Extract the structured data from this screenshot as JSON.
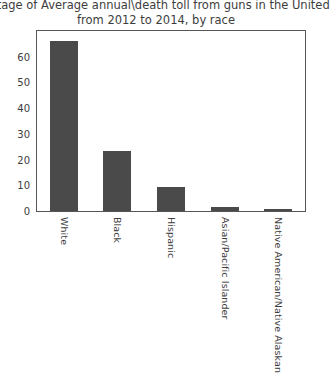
{
  "chart_data": {
    "type": "bar",
    "title": "entage of Average annual\\death toll from guns in the United",
    "title_line2": "from 2012 to 2014, by race",
    "title_lines": [
      "entage of Average annual\\death toll from guns in the United",
      "from 2012 to 2014, by race"
    ],
    "categories": [
      "White",
      "Black",
      "Hispanic",
      "Asian/Pacific Islander",
      "Native American/Native Alaskan"
    ],
    "values": [
      66,
      23.2,
      9.2,
      1.5,
      0.8
    ],
    "xlabel": "",
    "ylabel": "",
    "ylim": [
      0,
      70
    ],
    "yticks": [
      0,
      10,
      20,
      30,
      40,
      50,
      60
    ],
    "ytick_labels": [
      "0",
      "10",
      "20",
      "30",
      "40",
      "50",
      "60"
    ],
    "grid": false,
    "legend": false,
    "bar_color": "#4a4a4a",
    "axis_color": "#555555",
    "background_color": "#ffffff",
    "text_color": "#3d3d3d"
  }
}
